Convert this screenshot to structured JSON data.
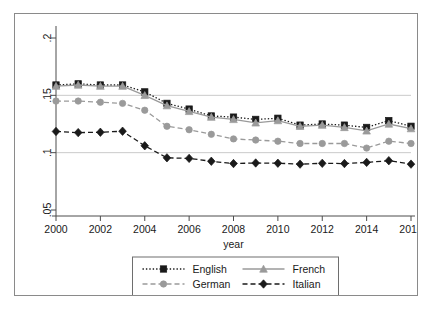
{
  "chart_data": {
    "type": "line",
    "title": "",
    "xlabel": "year",
    "ylabel": "",
    "xlim": [
      2000,
      2016
    ],
    "ylim": [
      0.05,
      0.2
    ],
    "xticks": [
      "2000",
      "2002",
      "2004",
      "2006",
      "2008",
      "2010",
      "2012",
      "2014",
      "2016"
    ],
    "yticks": [
      ".05",
      ".1",
      ".15",
      ".2"
    ],
    "grid": "horizontal gridlines at .1 and .15",
    "legend_position": "below axis, centered, two columns",
    "x": [
      2000,
      2001,
      2002,
      2003,
      2004,
      2005,
      2006,
      2007,
      2008,
      2009,
      2010,
      2011,
      2012,
      2013,
      2014,
      2015,
      2016
    ],
    "series": [
      {
        "name": "English",
        "color": "#1a1a1a",
        "marker": "square",
        "linestyle": "dotted",
        "values": [
          0.159,
          0.16,
          0.159,
          0.159,
          0.153,
          0.143,
          0.138,
          0.132,
          0.131,
          0.129,
          0.13,
          0.124,
          0.125,
          0.124,
          0.122,
          0.128,
          0.123
        ]
      },
      {
        "name": "French",
        "color": "#9a9a9a",
        "marker": "triangle",
        "linestyle": "solid",
        "values": [
          0.158,
          0.159,
          0.158,
          0.158,
          0.15,
          0.141,
          0.136,
          0.131,
          0.129,
          0.126,
          0.128,
          0.123,
          0.124,
          0.122,
          0.119,
          0.125,
          0.121
        ]
      },
      {
        "name": "German",
        "color": "#9a9a9a",
        "marker": "circle",
        "linestyle": "dashed",
        "values": [
          0.145,
          0.145,
          0.144,
          0.143,
          0.137,
          0.123,
          0.12,
          0.116,
          0.112,
          0.111,
          0.11,
          0.108,
          0.108,
          0.108,
          0.104,
          0.11,
          0.108
        ]
      },
      {
        "name": "Italian",
        "color": "#1a1a1a",
        "marker": "diamond",
        "linestyle": "dashed",
        "values": [
          0.1185,
          0.1175,
          0.1178,
          0.1187,
          0.106,
          0.0955,
          0.095,
          0.0925,
          0.0905,
          0.091,
          0.0908,
          0.09,
          0.0907,
          0.0905,
          0.0915,
          0.093,
          0.09
        ]
      }
    ]
  },
  "legend": {
    "items": [
      {
        "label": "English"
      },
      {
        "label": "French"
      },
      {
        "label": "German"
      },
      {
        "label": "Italian"
      }
    ]
  },
  "axis": {
    "xlabel": "year"
  }
}
